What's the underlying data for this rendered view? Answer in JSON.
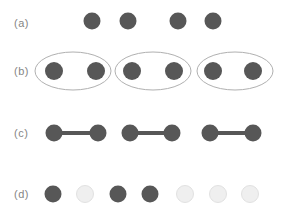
{
  "figure": {
    "colors": {
      "dark_dot": "#575757",
      "light_dot_fill": "#efefef",
      "light_dot_edge": "#e1e1e1",
      "ellipse_stroke": "#b0b0b0",
      "bond": "#575757",
      "label_text": "#858585",
      "background": "#ffffff"
    },
    "rows": [
      {
        "label": "(a)",
        "type": "dots",
        "y": 21,
        "radius": 8.5,
        "dots": [
          {
            "x": 92,
            "shade": "dark"
          },
          {
            "x": 128,
            "shade": "dark"
          },
          {
            "x": 178,
            "shade": "dark"
          },
          {
            "x": 213,
            "shade": "dark"
          }
        ]
      },
      {
        "label": "(b)",
        "type": "ellipse-pairs",
        "y": 71,
        "radius": 9,
        "ellipse_rx": 38,
        "ellipse_ry": 19,
        "ellipses": [
          {
            "cx": 73,
            "dots": [
              54,
              96
            ]
          },
          {
            "cx": 153,
            "dots": [
              132,
              174
            ]
          },
          {
            "cx": 235,
            "dots": [
              213,
              253
            ]
          }
        ]
      },
      {
        "label": "(c)",
        "type": "bonded-pairs",
        "y": 133,
        "radius": 8.5,
        "bond_width": 4,
        "pairs": [
          [
            54,
            98
          ],
          [
            130,
            172
          ],
          [
            210,
            253
          ]
        ]
      },
      {
        "label": "(d)",
        "type": "dots",
        "y": 194,
        "radius": 8.5,
        "dots": [
          {
            "x": 53,
            "shade": "dark"
          },
          {
            "x": 85,
            "shade": "light"
          },
          {
            "x": 118,
            "shade": "dark"
          },
          {
            "x": 150,
            "shade": "dark"
          },
          {
            "x": 185,
            "shade": "light"
          },
          {
            "x": 218,
            "shade": "light"
          },
          {
            "x": 250,
            "shade": "light"
          }
        ]
      }
    ]
  }
}
